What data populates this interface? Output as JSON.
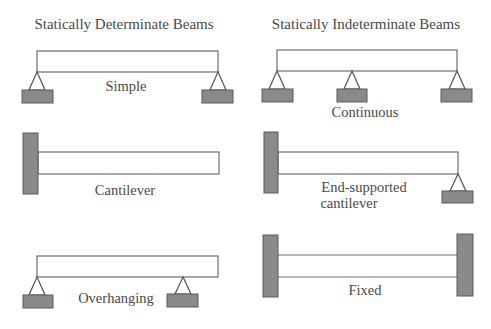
{
  "columns": {
    "left_title": "Statically Determinate Beams",
    "right_title": "Statically Indeterminate Beams"
  },
  "beams": {
    "simple": "Simple",
    "cantilever": "Cantilever",
    "overhanging": "Overhanging",
    "continuous": "Continuous",
    "end_supported_line1": "End-supported",
    "end_supported_line2": "cantilever",
    "fixed": "Fixed"
  },
  "colors": {
    "support_fill": "#8a8a8a",
    "line": "#6e6e6e",
    "text": "#4a4a4a"
  }
}
